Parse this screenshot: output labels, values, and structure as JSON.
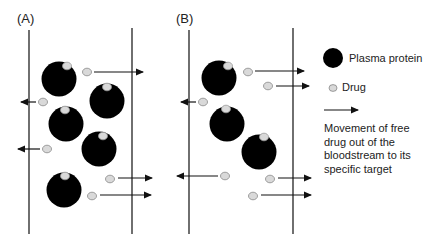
{
  "panels": [
    {
      "label": "(A)"
    },
    {
      "label": "(B)"
    }
  ],
  "legend": {
    "plasma_protein": "Plasma protein",
    "drug": "Drug",
    "arrow_desc_lines": [
      "Movement of free",
      "drug out of the",
      "bloodstream to its",
      "specific target"
    ]
  },
  "colors": {
    "protein": "#000000",
    "drug_fill": "#d9d9d9",
    "drug_stroke": "#888888",
    "line": "#222222"
  },
  "diagram": {
    "panel_A": {
      "vessel_walls_x": [
        29,
        132
      ],
      "proteins": [
        {
          "cx": 59,
          "cy": 79,
          "bound_drug": true
        },
        {
          "cx": 107,
          "cy": 101,
          "bound_drug": true
        },
        {
          "cx": 66,
          "cy": 124,
          "bound_drug": true
        },
        {
          "cx": 99,
          "cy": 149,
          "bound_drug": true
        },
        {
          "cx": 64,
          "cy": 190,
          "bound_drug": true
        }
      ],
      "free_drugs": [
        {
          "cx": 87,
          "cy": 72,
          "direction": "right"
        },
        {
          "cx": 43,
          "cy": 102,
          "direction": "left"
        },
        {
          "cx": 47,
          "cy": 149,
          "direction": "left"
        },
        {
          "cx": 110,
          "cy": 179,
          "direction": "right"
        },
        {
          "cx": 92,
          "cy": 196,
          "direction": "right"
        }
      ]
    },
    "panel_B": {
      "vessel_walls_x": [
        189,
        293
      ],
      "proteins": [
        {
          "cx": 219,
          "cy": 78,
          "bound_drug": true
        },
        {
          "cx": 227,
          "cy": 124,
          "bound_drug": true
        },
        {
          "cx": 259,
          "cy": 152,
          "bound_drug": true
        }
      ],
      "free_drugs": [
        {
          "cx": 248,
          "cy": 72,
          "direction": "right"
        },
        {
          "cx": 268,
          "cy": 86,
          "direction": "right"
        },
        {
          "cx": 203,
          "cy": 102,
          "direction": "left"
        },
        {
          "cx": 225,
          "cy": 176,
          "direction": "left"
        },
        {
          "cx": 270,
          "cy": 179,
          "direction": "right"
        },
        {
          "cx": 253,
          "cy": 196,
          "direction": "right"
        }
      ]
    }
  }
}
